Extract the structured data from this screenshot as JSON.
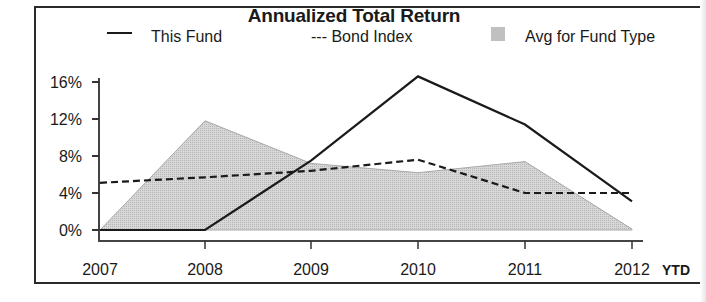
{
  "chart_data": {
    "type": "line",
    "title": "Annualized Total Return",
    "xlabel": "",
    "ylabel": "",
    "categories": [
      "2007",
      "2008",
      "2009",
      "2010",
      "2011",
      "2012"
    ],
    "x_suffix_label": "YTD",
    "y_ticks": [
      "0%",
      "4%",
      "8%",
      "12%",
      "16%"
    ],
    "ylim": [
      0,
      17
    ],
    "grid": false,
    "legend_position": "top",
    "series": [
      {
        "name": "This Fund",
        "style": "solid line",
        "values": [
          0,
          0,
          7.5,
          16.6,
          11.4,
          3.1
        ]
      },
      {
        "name": "Bond Index",
        "style": "dashed line",
        "values": [
          5.1,
          5.7,
          6.4,
          7.6,
          4.0,
          4.0
        ]
      },
      {
        "name": "Avg for Fund Type",
        "style": "shaded area",
        "values": [
          0,
          11.8,
          7.2,
          6.2,
          7.4,
          0.1
        ]
      }
    ]
  },
  "chart": {
    "title": "Annualized Total Return",
    "legend": {
      "this_fund": "This Fund",
      "bond_index": "--- Bond Index",
      "avg_fund_type": "Avg for Fund Type"
    },
    "y_ticks": [
      "16%",
      "12%",
      "8%",
      "4%",
      "0%"
    ],
    "x_ticks": [
      "2007",
      "2008",
      "2009",
      "2010",
      "2011",
      "2012"
    ],
    "ytd_label": "YTD",
    "colors": {
      "line": "#1a1a1a",
      "area_fill": "#d2d2d2",
      "area_edge": "#a0a0a0",
      "frame": "#2a2a2a"
    }
  }
}
